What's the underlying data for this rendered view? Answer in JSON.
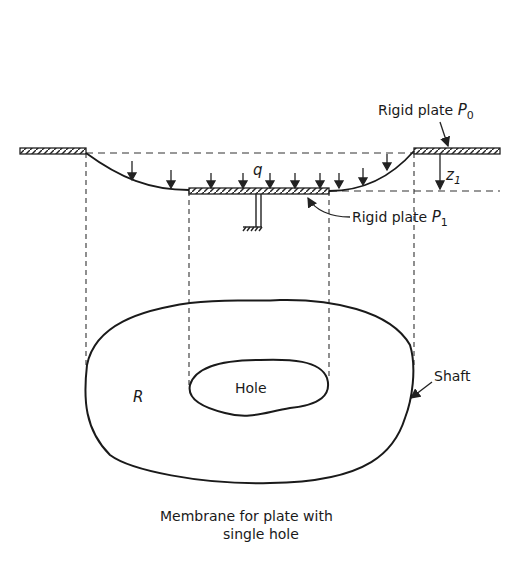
{
  "figure": {
    "caption_line1": "Membrane for plate with",
    "caption_line2": "single hole",
    "labels": {
      "rigid_plate_p0": "Rigid plate ",
      "p0_symbol": "P",
      "p0_sub": "0",
      "rigid_plate_p1": "Rigid plate ",
      "p1_symbol": "P",
      "p1_sub": "1",
      "load": "q",
      "z_symbol": "z",
      "z_sub": "1",
      "region": "R",
      "hole": "Hole",
      "shaft": "Shaft"
    }
  }
}
